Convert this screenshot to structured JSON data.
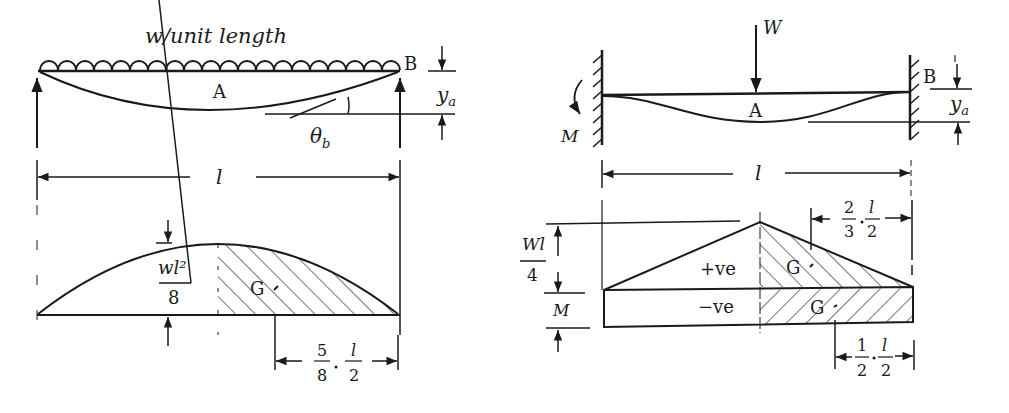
{
  "left_figure": {
    "load_label": "w/unit length",
    "point_a": "A",
    "point_b": "B",
    "deflection_label": "y",
    "deflection_sub": "a",
    "slope_label": "θ",
    "slope_sub": "b",
    "span_label": "l",
    "bm_peak_num": "wl²",
    "bm_peak_den": "8",
    "centroid_label": "G",
    "centroid_dist_frac1_num": "5",
    "centroid_dist_frac1_den": "8",
    "centroid_dist_frac2_num": "l",
    "centroid_dist_frac2_den": "2"
  },
  "right_figure": {
    "load_label": "W",
    "moment_label": "M",
    "point_a": "A",
    "point_b": "B",
    "deflection_label": "y",
    "deflection_sub": "a",
    "span_label": "l",
    "bm_peak_num": "Wl",
    "bm_peak_den": "4",
    "bm_fixed_label": "M",
    "positive_label": "+ve",
    "negative_label": "−ve",
    "centroid_pos_label": "G",
    "centroid_neg_label": "G",
    "pos_dist_frac1_num": "2",
    "pos_dist_frac1_den": "3",
    "pos_dist_frac2_num": "l",
    "pos_dist_frac2_den": "2",
    "neg_dist_frac1_num": "1",
    "neg_dist_frac1_den": "2",
    "neg_dist_frac2_num": "l",
    "neg_dist_frac2_den": "2"
  }
}
